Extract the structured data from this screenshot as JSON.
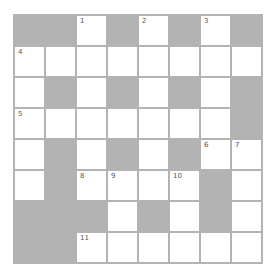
{
  "puzzle": {
    "rows": 8,
    "cols": 8,
    "colors": {
      "block": "#b3b3b3",
      "cell": "#ffffff",
      "line": "#b3b3b3",
      "number": "#555555"
    },
    "layout": [
      "BBWBWBWB",
      "WWWWWWWW",
      "WBWBWBWB",
      "WWWWWWWB",
      "WBWBWBWW",
      "WBWWWWBW",
      "BBBWBWBW",
      "BBWWWWWW"
    ],
    "numbers": [
      {
        "r": 0,
        "c": 2,
        "n": "1"
      },
      {
        "r": 0,
        "c": 4,
        "n": "2"
      },
      {
        "r": 0,
        "c": 6,
        "n": "3"
      },
      {
        "r": 1,
        "c": 0,
        "n": "4"
      },
      {
        "r": 3,
        "c": 0,
        "n": "5"
      },
      {
        "r": 4,
        "c": 6,
        "n": "6"
      },
      {
        "r": 4,
        "c": 7,
        "n": "7"
      },
      {
        "r": 5,
        "c": 2,
        "n": "8"
      },
      {
        "r": 5,
        "c": 3,
        "n": "9"
      },
      {
        "r": 5,
        "c": 5,
        "n": "10"
      },
      {
        "r": 7,
        "c": 2,
        "n": "11"
      }
    ]
  }
}
